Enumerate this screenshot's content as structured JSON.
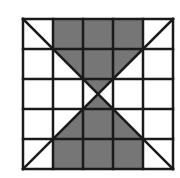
{
  "figure": {
    "grid": {
      "rows": 5,
      "cols": 5,
      "origin": [
        23,
        19
      ],
      "cell_size": 30,
      "line_color": "#1a1a1a",
      "line_width": 2.5
    },
    "colors": {
      "fill": "#767676",
      "background": "#ffffff"
    },
    "diagonals": [
      {
        "from": "top-left",
        "to": "bottom-right"
      },
      {
        "from": "top-right",
        "to": "bottom-left"
      }
    ],
    "shaded_cells_full": [
      [
        0,
        1
      ],
      [
        0,
        2
      ],
      [
        0,
        3
      ],
      [
        1,
        2
      ],
      [
        3,
        2
      ],
      [
        4,
        1
      ],
      [
        4,
        2
      ],
      [
        4,
        3
      ]
    ],
    "shaded_triangles": [
      {
        "row": 1,
        "col": 1,
        "part": "upper-right"
      },
      {
        "row": 1,
        "col": 3,
        "part": "upper-left"
      },
      {
        "row": 2,
        "col": 2,
        "part": "top"
      },
      {
        "row": 2,
        "col": 2,
        "part": "bottom"
      },
      {
        "row": 3,
        "col": 1,
        "part": "lower-right"
      },
      {
        "row": 3,
        "col": 3,
        "part": "lower-left"
      }
    ]
  }
}
